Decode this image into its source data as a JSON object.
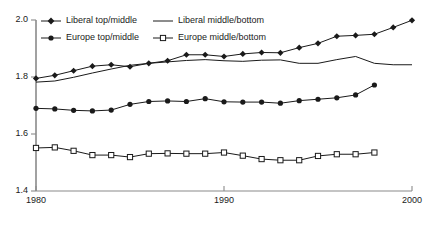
{
  "chart_data": {
    "type": "line",
    "title": "",
    "subtitle": "",
    "xlabel": "",
    "ylabel": "",
    "xlim": [
      1980,
      2000
    ],
    "ylim": [
      1.4,
      2.0
    ],
    "grid": false,
    "legend_position": "top-left",
    "x_ticks": [
      "1980",
      "1990",
      "2000"
    ],
    "x_tick_values": [
      1980,
      1990,
      2000
    ],
    "y_ticks": [
      "1.4",
      "1.6",
      "1.8",
      "2.0"
    ],
    "y_tick_values": [
      1.4,
      1.6,
      1.8,
      2.0
    ],
    "series": [
      {
        "name": "Liberal top/middle",
        "marker": "diamond-filled",
        "color": "#1a1a1a",
        "x": [
          1980,
          1981,
          1982,
          1983,
          1984,
          1985,
          1986,
          1987,
          1988,
          1989,
          1990,
          1991,
          1992,
          1993,
          1994,
          1995,
          1996,
          1997,
          1998,
          1999,
          2000
        ],
        "values": [
          1.795,
          1.806,
          1.822,
          1.838,
          1.843,
          1.836,
          1.848,
          1.857,
          1.878,
          1.878,
          1.872,
          1.881,
          1.886,
          1.885,
          1.903,
          1.918,
          1.943,
          1.946,
          1.95,
          1.974,
          1.999
        ]
      },
      {
        "name": "Liberal middle/bottom",
        "marker": "none",
        "color": "#1a1a1a",
        "x": [
          1980,
          1981,
          1982,
          1983,
          1984,
          1985,
          1986,
          1987,
          1988,
          1989,
          1990,
          1991,
          1992,
          1993,
          1994,
          1995,
          1996,
          1997,
          1998,
          1999,
          2000
        ],
        "values": [
          1.782,
          1.786,
          1.799,
          1.814,
          1.828,
          1.841,
          1.848,
          1.853,
          1.858,
          1.861,
          1.857,
          1.855,
          1.859,
          1.86,
          1.848,
          1.848,
          1.861,
          1.872,
          1.848,
          1.843,
          1.843
        ]
      },
      {
        "name": "Europe top/middle",
        "marker": "circle-filled",
        "color": "#1a1a1a",
        "x": [
          1980,
          1981,
          1982,
          1983,
          1984,
          1985,
          1986,
          1987,
          1988,
          1989,
          1990,
          1991,
          1992,
          1993,
          1994,
          1995,
          1996,
          1997,
          1998
        ],
        "values": [
          1.69,
          1.688,
          1.683,
          1.681,
          1.684,
          1.704,
          1.714,
          1.716,
          1.714,
          1.724,
          1.713,
          1.712,
          1.712,
          1.708,
          1.717,
          1.722,
          1.727,
          1.737,
          1.772
        ]
      },
      {
        "name": "Europe middle/bottom",
        "marker": "square-open",
        "color": "#1a1a1a",
        "x": [
          1980,
          1981,
          1982,
          1983,
          1984,
          1985,
          1986,
          1987,
          1988,
          1989,
          1990,
          1991,
          1992,
          1993,
          1994,
          1995,
          1996,
          1997,
          1998
        ],
        "values": [
          1.551,
          1.553,
          1.541,
          1.526,
          1.526,
          1.519,
          1.531,
          1.532,
          1.531,
          1.531,
          1.535,
          1.524,
          1.512,
          1.508,
          1.508,
          1.523,
          1.529,
          1.529,
          1.535
        ]
      }
    ]
  },
  "legend": {
    "items": [
      {
        "label": "Liberal top/middle",
        "marker": "diamond-filled"
      },
      {
        "label": "Liberal middle/bottom",
        "marker": "line"
      },
      {
        "label": "Europe top/middle",
        "marker": "circle-filled"
      },
      {
        "label": "Europe middle/bottom",
        "marker": "square-open"
      }
    ]
  },
  "axes": {
    "y_labels": [
      "2.0",
      "1.8",
      "1.6",
      "1.4"
    ],
    "x_labels": [
      "1980",
      "1990",
      "2000"
    ]
  },
  "colors": {
    "line": "#1a1a1a",
    "axis": "#808080",
    "background": "#ffffff"
  }
}
